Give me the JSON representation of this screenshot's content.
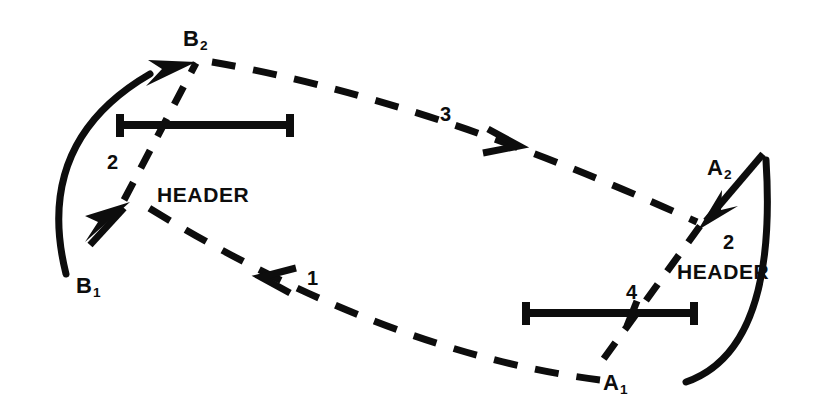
{
  "figure": {
    "kind": "technical-line-diagram",
    "background_color": "#ffffff",
    "ink_color": "#0d0d0d",
    "width": 817,
    "height": 417
  },
  "nodes": [
    {
      "id": "B2",
      "base": "B",
      "sub": "2",
      "x": 195,
      "y": 40,
      "label_x": 183,
      "label_y": 28
    },
    {
      "id": "B1",
      "base": "B",
      "sub": "1",
      "x": 65,
      "y": 272,
      "label_x": 76,
      "label_y": 275
    },
    {
      "id": "A2",
      "base": "A",
      "sub": "2",
      "x": 765,
      "y": 155,
      "label_x": 707,
      "label_y": 157
    },
    {
      "id": "A1",
      "base": "A",
      "sub": "1",
      "x": 690,
      "y": 380,
      "label_x": 603,
      "label_y": 372
    }
  ],
  "headers": [
    {
      "id": "header-left",
      "text": "HEADER",
      "x": 157,
      "y": 184
    },
    {
      "id": "header-right",
      "text": "HEADER",
      "x": 677,
      "y": 261
    }
  ],
  "segment_numbers": [
    {
      "id": "num-2-left",
      "text": "2",
      "x": 107,
      "y": 152
    },
    {
      "id": "num-2-right",
      "text": "2",
      "x": 723,
      "y": 232
    },
    {
      "id": "num-3",
      "text": "3",
      "x": 440,
      "y": 104
    },
    {
      "id": "num-1",
      "text": "1",
      "x": 307,
      "y": 268
    },
    {
      "id": "num-4",
      "text": "4",
      "x": 626,
      "y": 282
    }
  ],
  "bars": [
    {
      "id": "bar-left",
      "x1": 118,
      "x2": 292,
      "y": 125,
      "cap_half_height": 11,
      "tick_x": null
    },
    {
      "id": "bar-right",
      "x1": 524,
      "x2": 696,
      "y": 313,
      "cap_half_height": 11,
      "tick_x": 632
    }
  ],
  "solid_arcs": [
    {
      "id": "arc-b1-to-b2",
      "from": "B1",
      "to": "B2",
      "description": "solid curved arrow sweeping left and up from B1 to arrowhead at B2"
    },
    {
      "id": "arc-a1-to-a2",
      "from": "A1",
      "to": "A2",
      "description": "solid curved line sweeping right and up from A1 to A2, continuing as straight arrow down-left into the right vertex"
    }
  ],
  "dashed_paths": [
    {
      "id": "dash-b2-to-a2",
      "label": "3",
      "from": "B2",
      "to": "A2",
      "arrow_direction": "right-down",
      "arrow_x": 512,
      "arrow_y": 140
    },
    {
      "id": "dash-a1-to-b1-vertex",
      "label": "1",
      "from": "A1",
      "to": "left-vertex",
      "arrow_direction": "left-up",
      "arrow_x": 266,
      "arrow_y": 277
    },
    {
      "id": "dash-left-vertex-to-b2",
      "label": "2",
      "from": "left-vertex",
      "to": "B2"
    },
    {
      "id": "dash-right-vertex-to-a1",
      "label": "4",
      "from": "right-vertex",
      "to": "A1"
    }
  ],
  "vertices": [
    {
      "id": "left-vertex",
      "x": 128,
      "y": 206
    },
    {
      "id": "right-vertex",
      "x": 700,
      "y": 228
    }
  ],
  "arrowheads": [
    {
      "id": "arrowhead-b2",
      "style": "filled-triangle",
      "at": "B2",
      "direction": "up-right"
    },
    {
      "id": "arrowhead-left-vertex",
      "style": "filled-triangle",
      "at": "left-vertex",
      "direction": "up-right"
    },
    {
      "id": "arrowhead-a2-inward",
      "style": "filled-triangle",
      "at": "right-vertex",
      "direction": "down-left"
    },
    {
      "id": "arrowhead-3",
      "style": "open-chevron",
      "at": "dash-b2-to-a2",
      "direction": "right-down"
    },
    {
      "id": "arrowhead-1",
      "style": "open-chevron",
      "at": "dash-a1-to-b1-vertex",
      "direction": "left-up"
    }
  ]
}
